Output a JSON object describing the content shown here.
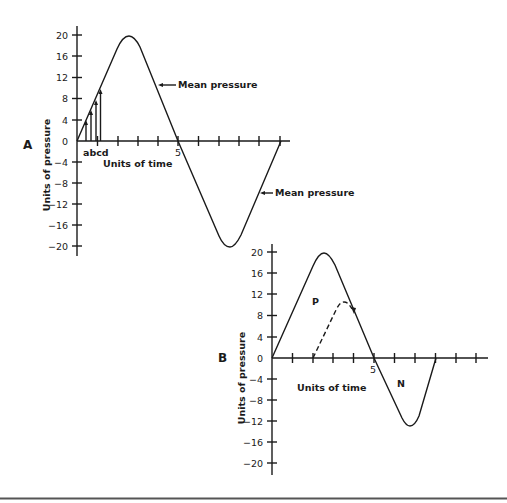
{
  "figure": {
    "panel_a": {
      "label": "A",
      "ylabel": "Units of pressure",
      "xlabel": "Units of time",
      "yticks": [
        "20",
        "16",
        "12",
        "8",
        "4",
        "0",
        "−4",
        "−8",
        "−12",
        "−16",
        "−20"
      ],
      "x_marker": "5",
      "sub_labels": "abcd",
      "annotation_top": "Mean pressure",
      "annotation_bottom": "Mean pressure"
    },
    "panel_b": {
      "label": "B",
      "ylabel": "Units of pressure",
      "xlabel": "Units of time",
      "yticks": [
        "20",
        "16",
        "12",
        "8",
        "4",
        "0",
        "−4",
        "−8",
        "−12",
        "−16",
        "−20"
      ],
      "x_marker": "5",
      "positive_label": "P",
      "negative_label": "N"
    },
    "colors": {
      "ink": "#1a1a1a",
      "background": "#ffffff",
      "rule": "#555555"
    }
  }
}
